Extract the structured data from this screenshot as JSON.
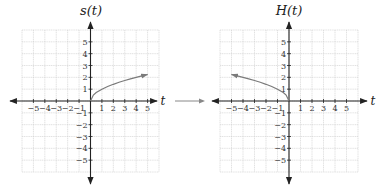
{
  "figure": {
    "connector_arrow": "right-arrow",
    "charts_count": 2
  },
  "chart_data": [
    {
      "type": "line",
      "title": "s(t)",
      "xlabel": "t",
      "ylabel": "s(t)",
      "xlim": [
        -6,
        6
      ],
      "ylim": [
        -6,
        6
      ],
      "grid": true,
      "x_ticks": [
        -5,
        -4,
        -3,
        -2,
        -1,
        1,
        2,
        3,
        4,
        5
      ],
      "y_ticks": [
        5,
        4,
        3,
        2,
        1,
        -1,
        -2,
        -3,
        -4,
        -5
      ],
      "series": [
        {
          "name": "s(t) = sqrt(t)",
          "color": "#7a7a7a",
          "x": [
            0,
            0.25,
            0.5,
            1,
            1.5,
            2,
            2.5,
            3,
            3.5,
            4,
            4.5,
            5
          ],
          "y": [
            0,
            0.5,
            0.71,
            1,
            1.22,
            1.41,
            1.58,
            1.73,
            1.87,
            2,
            2.12,
            2.24
          ],
          "end_arrow": "right"
        }
      ]
    },
    {
      "type": "line",
      "title": "H(t)",
      "xlabel": "t",
      "ylabel": "H(t)",
      "xlim": [
        -6,
        6
      ],
      "ylim": [
        -6,
        6
      ],
      "grid": true,
      "x_ticks": [
        -5,
        -4,
        -3,
        -2,
        -1,
        1,
        2,
        3,
        4,
        5
      ],
      "y_ticks": [
        5,
        4,
        3,
        2,
        1,
        -1,
        -2,
        -3,
        -4,
        -5
      ],
      "series": [
        {
          "name": "H(t) = sqrt(-t)",
          "color": "#7a7a7a",
          "x": [
            0,
            -0.25,
            -0.5,
            -1,
            -1.5,
            -2,
            -2.5,
            -3,
            -3.5,
            -4,
            -4.5,
            -5
          ],
          "y": [
            0,
            0.5,
            0.71,
            1,
            1.22,
            1.41,
            1.58,
            1.73,
            1.87,
            2,
            2.12,
            2.24
          ],
          "end_arrow": "left"
        }
      ]
    }
  ]
}
